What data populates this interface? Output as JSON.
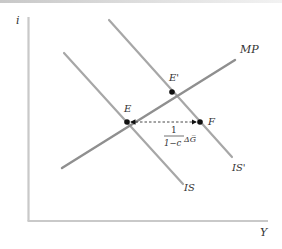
{
  "diagram": {
    "type": "IS-MP shift",
    "axes": {
      "y_label": "i",
      "x_label": "Y",
      "color": "#c9c9c9"
    },
    "curves": [
      {
        "id": "IS",
        "label": "IS",
        "color": "#a7a7a7",
        "from": [
          64,
          53
        ],
        "to": [
          183,
          184
        ]
      },
      {
        "id": "IS_prime",
        "label": "IS'",
        "color": "#a7a7a7",
        "from": [
          109,
          20
        ],
        "to": [
          232,
          157
        ]
      },
      {
        "id": "MP",
        "label": "MP",
        "color": "#8f8f8f",
        "from": [
          62,
          168
        ],
        "to": [
          235,
          60
        ]
      }
    ],
    "points": [
      {
        "id": "E",
        "label": "E",
        "at": [
          127,
          122
        ]
      },
      {
        "id": "E_prime",
        "label": "E'",
        "at": [
          172,
          92
        ]
      },
      {
        "id": "F",
        "label": "F",
        "at": [
          200,
          122
        ]
      }
    ],
    "shift_arrow": {
      "from": "E",
      "to": "F",
      "style": "dashed",
      "multiplier_numerator": "1",
      "multiplier_denominator": "1−c",
      "change_term": "ΔG̅"
    }
  }
}
